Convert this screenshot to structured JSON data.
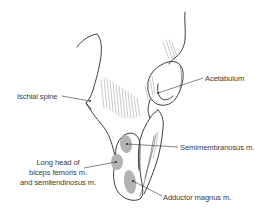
{
  "figure": {
    "labels": {
      "ischial_spine": "Ischial spine",
      "acetabulum": "Acetabulum",
      "semimembranosus": "Semimembranosus m.",
      "long_head_line1": "Long head of",
      "long_head_line2": "biceps femoris m.",
      "long_head_line3": "and semitendinosus m.",
      "adductor_magnus": "Adductor magnus m."
    },
    "colors": {
      "line": "#2a2a2a",
      "attachment_area": "#b3b3b3",
      "text": "#3a3a3a",
      "background": "#ffffff"
    }
  }
}
